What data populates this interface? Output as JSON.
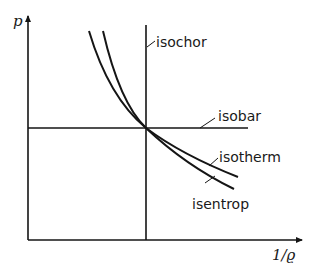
{
  "diagram": {
    "title": "",
    "axes": {
      "y_label": "p",
      "x_label": "1/ϱ"
    },
    "curves": [
      {
        "name": "isochor",
        "label": "isochor",
        "kind": "vertical line"
      },
      {
        "name": "isobar",
        "label": "isobar",
        "kind": "horizontal line"
      },
      {
        "name": "isotherm",
        "label": "isotherm",
        "kind": "hyperbola"
      },
      {
        "name": "isentrop",
        "label": "isentrop",
        "kind": "steeper curve"
      }
    ],
    "colors": {
      "line": "#151515",
      "background": "#ffffff"
    }
  }
}
